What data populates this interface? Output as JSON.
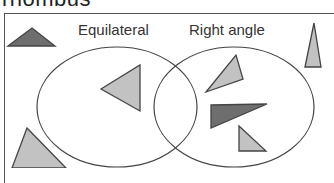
{
  "title": "rhombus",
  "venn": {
    "sets": [
      {
        "label": "Equilateral",
        "cx": 117,
        "cy": 107,
        "rx": 80,
        "ry": 60
      },
      {
        "label": "Right angle",
        "cx": 234,
        "cy": 107,
        "rx": 80,
        "ry": 60
      }
    ],
    "colors": {
      "stroke": "#444444",
      "light_fill": "#c2c2c2",
      "dark_fill": "#6e6e6e"
    },
    "shapes": [
      {
        "id": "outside-dark-topleft",
        "points": "8,46 32,28 55,46",
        "fill": "dark",
        "region": "outside"
      },
      {
        "id": "outside-tall-right",
        "points": "305,67 314,23 321,67",
        "fill": "light",
        "region": "outside"
      },
      {
        "id": "equilateral-only",
        "points": "101,89 140,65 140,111",
        "fill": "light",
        "region": "equilateral"
      },
      {
        "id": "right-upper",
        "points": "206,92 236,55 243,79",
        "fill": "light",
        "region": "right-angle"
      },
      {
        "id": "right-dark",
        "points": "211,105 267,104 211,128",
        "fill": "dark",
        "region": "right-angle"
      },
      {
        "id": "right-small",
        "points": "239,126 266,151 239,151",
        "fill": "light",
        "region": "right-angle"
      },
      {
        "id": "outside-bottom-left",
        "points": "12,168 27,128 66,168",
        "fill": "light",
        "region": "outside"
      }
    ]
  }
}
